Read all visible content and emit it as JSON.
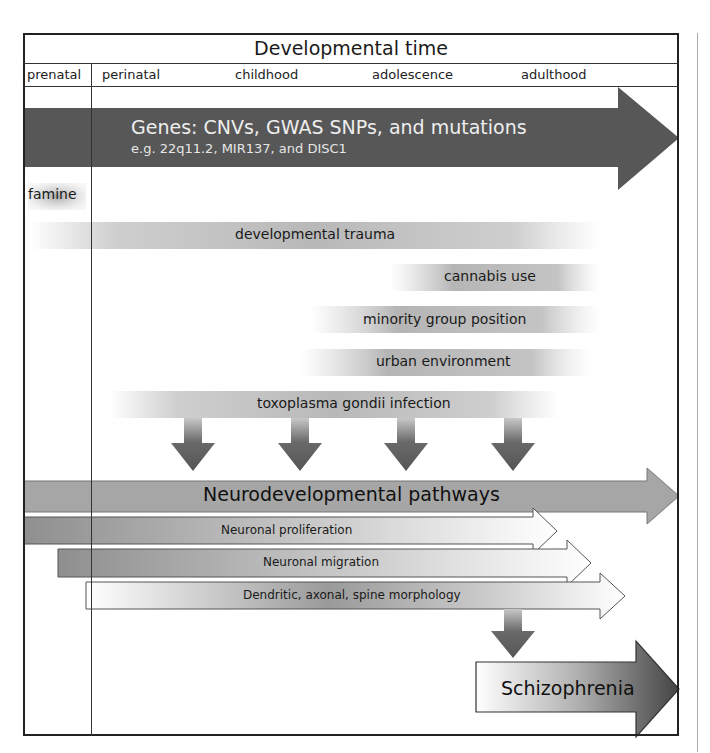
{
  "header": {
    "title": "Developmental time",
    "phases": [
      "prenatal",
      "perinatal",
      "childhood",
      "adolescence",
      "adulthood"
    ]
  },
  "genes": {
    "title": "Genes: CNVs, GWAS SNPs, and mutations",
    "subtitle": "e.g. 22q11.2, MIR137, and DISC1",
    "color": "#555555"
  },
  "environmental_factors": [
    {
      "label": "famine"
    },
    {
      "label": "developmental trauma"
    },
    {
      "label": "cannabis use"
    },
    {
      "label": "minority group position"
    },
    {
      "label": "urban environment"
    },
    {
      "label": "toxoplasma gondii infection"
    }
  ],
  "pathways": {
    "title": "Neurodevelopmental pathways",
    "items": [
      {
        "label": "Neuronal proliferation"
      },
      {
        "label": "Neuronal migration"
      },
      {
        "label": "Dendritic, axonal, spine morphology"
      }
    ]
  },
  "outcome": {
    "label": "Schizophrenia"
  },
  "colors": {
    "dark_arrow": "#575757",
    "mid_arrow": "#a8a8a8",
    "border": "#222222"
  }
}
